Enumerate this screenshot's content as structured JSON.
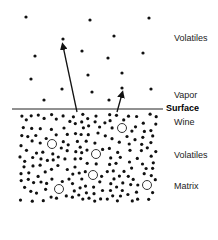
{
  "labels": {
    "vapor_volatiles": "Volatiles",
    "vapor": "Vapor",
    "surface": "Surface",
    "wine": "Wine",
    "wine_volatiles": "Volatiles",
    "matrix": "Matrix"
  },
  "colors": {
    "dot": "#111111",
    "line": "#222222",
    "background": "#ffffff"
  },
  "vapor_dots": [
    [
      26,
      17
    ],
    [
      90,
      20
    ],
    [
      149,
      18
    ],
    [
      63,
      39
    ],
    [
      114,
      36
    ],
    [
      35,
      56
    ],
    [
      82,
      51
    ],
    [
      108,
      58
    ],
    [
      143,
      53
    ],
    [
      31,
      79
    ],
    [
      88,
      75
    ],
    [
      122,
      73
    ],
    [
      62,
      89
    ],
    [
      92,
      92
    ],
    [
      122,
      88
    ],
    [
      151,
      89
    ],
    [
      44,
      100
    ],
    [
      109,
      100
    ]
  ],
  "matrix_circles": [
    [
      52,
      144
    ],
    [
      122,
      128
    ],
    [
      96,
      154
    ],
    [
      93,
      175
    ],
    [
      59,
      189
    ],
    [
      147,
      185
    ]
  ],
  "arrows": [
    {
      "from": [
        77,
        112
      ],
      "to": [
        63,
        46
      ]
    },
    {
      "from": [
        117,
        112
      ],
      "to": [
        122,
        94
      ]
    }
  ]
}
